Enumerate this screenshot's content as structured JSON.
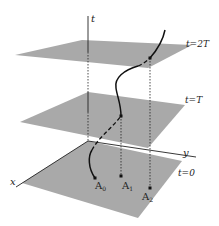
{
  "diagram": {
    "type": "3d-spacetime-planes",
    "colors": {
      "plane": "#a9a9a9",
      "line": "#111111",
      "background": "#ffffff"
    },
    "axes": {
      "t_label": "t",
      "x_label": "x",
      "y_label": "y"
    },
    "planes": [
      {
        "id": "plane-2T",
        "label": "t=2T"
      },
      {
        "id": "plane-T",
        "label": "t=T"
      },
      {
        "id": "plane-0",
        "label": "t=0"
      }
    ],
    "points": [
      {
        "id": "A0",
        "base": "A",
        "sub": "0"
      },
      {
        "id": "A1",
        "base": "A",
        "sub": "1"
      },
      {
        "id": "A2",
        "base": "A",
        "sub": "2"
      }
    ]
  }
}
